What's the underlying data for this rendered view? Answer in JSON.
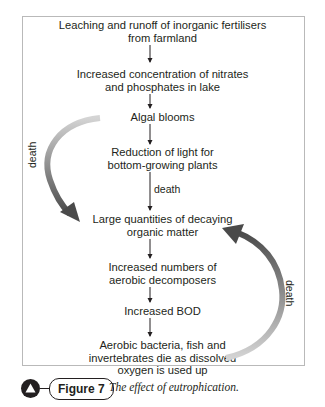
{
  "diagram": {
    "nodes": [
      {
        "id": "n1",
        "text": "Leaching and runoff of inorganic fertilisers\nfrom farmland"
      },
      {
        "id": "n2",
        "text": "Increased concentration of nitrates\nand phosphates in lake"
      },
      {
        "id": "n3",
        "text": "Algal blooms"
      },
      {
        "id": "n4",
        "text": "Reduction of light for\nbottom-growing plants"
      },
      {
        "id": "n5",
        "text": "Large quantities of decaying\norganic matter"
      },
      {
        "id": "n6",
        "text": "Increased numbers of\naerobic decomposers"
      },
      {
        "id": "n7",
        "text": "Increased BOD"
      },
      {
        "id": "n8",
        "text": "Aerobic bacteria, fish and\ninvertebrates die as dissolved\noxygen is used up"
      }
    ],
    "edges": [
      {
        "from": "n1",
        "to": "n2",
        "label": ""
      },
      {
        "from": "n2",
        "to": "n3",
        "label": ""
      },
      {
        "from": "n3",
        "to": "n4",
        "label": ""
      },
      {
        "from": "n4",
        "to": "n5",
        "label": "death"
      },
      {
        "from": "n5",
        "to": "n6",
        "label": ""
      },
      {
        "from": "n6",
        "to": "n7",
        "label": ""
      },
      {
        "from": "n7",
        "to": "n8",
        "label": ""
      },
      {
        "from": "n3",
        "to": "n5",
        "label": "death",
        "style": "curved-left"
      },
      {
        "from": "n8",
        "to": "n5",
        "label": "death",
        "style": "curved-right"
      }
    ],
    "labels": {
      "mid_death": "death",
      "left_death": "death",
      "right_death": "death"
    }
  },
  "caption": {
    "figure_label": "Figure 7",
    "text": "The effect of eutrophication."
  }
}
